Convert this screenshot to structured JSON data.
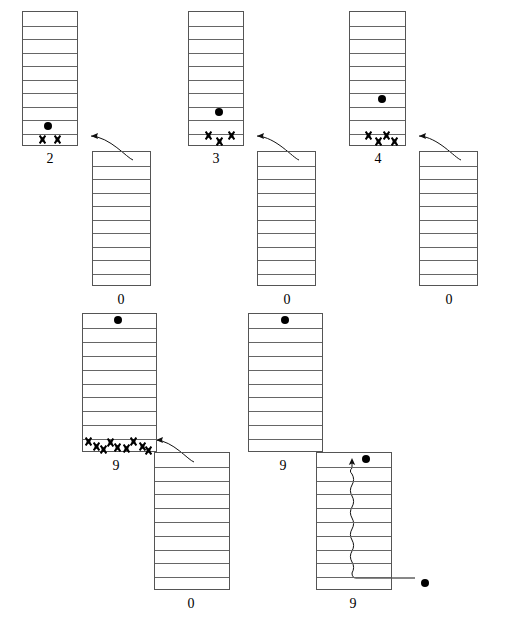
{
  "figure": {
    "type": "diagram",
    "width": 510,
    "height": 628,
    "background": "#ffffff",
    "line_color": "#555555",
    "mark_color": "#000000"
  },
  "frames": [
    {
      "id": "frame-1",
      "upper": {
        "x": 22,
        "y": 11,
        "w": 56,
        "h": 135,
        "rows": 10,
        "label": "2",
        "label_x": 50,
        "label_y": 152,
        "tokens": [
          {
            "type": "dot",
            "row": 9,
            "cx": 48
          }
        ],
        "xmarks": [
          {
            "row": 10,
            "cx": 42,
            "dy": 0
          },
          {
            "row": 10,
            "cx": 57,
            "dy": 0
          }
        ]
      },
      "lower": {
        "x": 92,
        "y": 151,
        "w": 59,
        "h": 135,
        "rows": 10,
        "label": "0",
        "label_x": 121,
        "label_y": 293,
        "tokens": [],
        "xmarks": []
      },
      "arrow": {
        "from_x": 133,
        "from_y": 160,
        "to_x": 91,
        "to_y": 136,
        "curve": "up-left"
      }
    },
    {
      "id": "frame-2",
      "upper": {
        "x": 188,
        "y": 11,
        "w": 56,
        "h": 135,
        "rows": 10,
        "label": "3",
        "label_x": 216,
        "label_y": 152,
        "tokens": [
          {
            "type": "dot",
            "row": 8,
            "cx": 219
          }
        ],
        "xmarks": [
          {
            "row": 10,
            "cx": 208,
            "dy": -4
          },
          {
            "row": 10,
            "cx": 219,
            "dy": 2
          },
          {
            "row": 10,
            "cx": 231,
            "dy": -4
          }
        ]
      },
      "lower": {
        "x": 257,
        "y": 151,
        "w": 59,
        "h": 135,
        "rows": 10,
        "label": "0",
        "label_x": 287,
        "label_y": 293,
        "tokens": [],
        "xmarks": []
      },
      "arrow": {
        "from_x": 299,
        "from_y": 160,
        "to_x": 257,
        "to_y": 136,
        "curve": "up-left"
      }
    },
    {
      "id": "frame-3",
      "upper": {
        "x": 349,
        "y": 11,
        "w": 57,
        "h": 135,
        "rows": 10,
        "label": "4",
        "label_x": 378,
        "label_y": 152,
        "tokens": [
          {
            "type": "dot",
            "row": 7,
            "cx": 382
          }
        ],
        "xmarks": [
          {
            "row": 10,
            "cx": 368,
            "dy": -4
          },
          {
            "row": 10,
            "cx": 378,
            "dy": 2
          },
          {
            "row": 10,
            "cx": 386,
            "dy": -4
          },
          {
            "row": 10,
            "cx": 394,
            "dy": 2
          }
        ]
      },
      "lower": {
        "x": 419,
        "y": 151,
        "w": 59,
        "h": 135,
        "rows": 10,
        "label": "0",
        "label_x": 449,
        "label_y": 293,
        "tokens": [],
        "xmarks": []
      },
      "arrow": {
        "from_x": 461,
        "from_y": 160,
        "to_x": 419,
        "to_y": 136,
        "curve": "up-left"
      }
    },
    {
      "id": "frame-4",
      "upper": {
        "x": 82,
        "y": 313,
        "w": 75,
        "h": 139,
        "rows": 10,
        "label": "9",
        "label_x": 116,
        "label_y": 459,
        "tokens": [
          {
            "type": "dot",
            "row": 1,
            "cx": 118
          }
        ],
        "xmarks": [
          {
            "row": 10,
            "cx": 88,
            "dy": -4
          },
          {
            "row": 10,
            "cx": 96,
            "dy": 1
          },
          {
            "row": 10,
            "cx": 103,
            "dy": 4
          },
          {
            "row": 10,
            "cx": 110,
            "dy": -3
          },
          {
            "row": 10,
            "cx": 117,
            "dy": 2
          },
          {
            "row": 10,
            "cx": 126,
            "dy": 3
          },
          {
            "row": 10,
            "cx": 133,
            "dy": -4
          },
          {
            "row": 10,
            "cx": 142,
            "dy": 1
          },
          {
            "row": 10,
            "cx": 148,
            "dy": 5
          }
        ]
      },
      "lower": {
        "x": 154,
        "y": 452,
        "w": 76,
        "h": 138,
        "rows": 10,
        "label": "0",
        "label_x": 191,
        "label_y": 597,
        "tokens": [],
        "xmarks": []
      },
      "arrow": {
        "from_x": 194,
        "from_y": 462,
        "to_x": 156,
        "to_y": 440,
        "curve": "up-left"
      }
    },
    {
      "id": "frame-5",
      "upper": {
        "x": 248,
        "y": 313,
        "w": 75,
        "h": 139,
        "rows": 10,
        "label": "9",
        "label_x": 283,
        "label_y": 459,
        "tokens": [
          {
            "type": "dot",
            "row": 1,
            "cx": 285
          }
        ],
        "xmarks": []
      },
      "lower": null,
      "arrow": null
    },
    {
      "id": "frame-6",
      "upper": null,
      "lower": {
        "x": 316,
        "y": 452,
        "w": 76,
        "h": 138,
        "rows": 10,
        "label": "9",
        "label_x": 353,
        "label_y": 597,
        "tokens": [
          {
            "type": "dot",
            "row": 1,
            "cx": 366,
            "outside_top": true
          },
          {
            "type": "dot",
            "row": 10,
            "cx": 425,
            "outside_right": true
          }
        ],
        "xmarks": []
      },
      "wavy_arrow": {
        "entry_x": 415,
        "entry_y": 578,
        "turn_x": 352,
        "turn_y": 578,
        "tip_x": 352,
        "tip_y": 458,
        "description": "wavy vertical path rising from bottom-right dot to top of ladder"
      }
    }
  ],
  "legend": {
    "dot_meaning": "token",
    "x_meaning": "mark",
    "labels_meaning": "counter value below each ladder"
  }
}
